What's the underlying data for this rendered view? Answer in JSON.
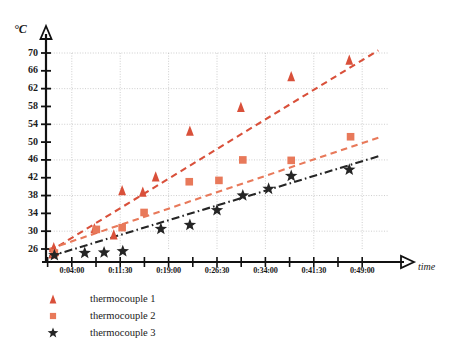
{
  "chart_data": {
    "type": "scatter",
    "title": "",
    "xlabel": "time",
    "ylabel": "°C",
    "grid": true,
    "legend_position": "bottom-left",
    "ylim": [
      24,
      72
    ],
    "yticks": [
      26,
      30,
      34,
      38,
      42,
      46,
      50,
      54,
      58,
      62,
      66,
      70
    ],
    "ytick_labels": [
      "26",
      "30",
      "34",
      "38",
      "42",
      "46",
      "50",
      "54",
      "58",
      "62",
      "66",
      "70"
    ],
    "xtick_labels": [
      "0:04:00",
      "0:11:30",
      "0:19:00",
      "0:26:30",
      "0:34:00",
      "0:41:30",
      "0:49:00"
    ],
    "xtick_minutes": [
      4,
      11.5,
      19,
      26.5,
      34,
      41.5,
      49
    ],
    "xlim_minutes": [
      0,
      53
    ],
    "series": [
      {
        "name": "thermocouple 1",
        "marker": "triangle",
        "color": "#d9503a",
        "trendline": "dashed",
        "points": [
          {
            "x": 1.0,
            "y": 25.0
          },
          {
            "x": 1.2,
            "y": 26.4
          },
          {
            "x": 1.4,
            "y": 25.6
          },
          {
            "x": 7.5,
            "y": 30.7
          },
          {
            "x": 10.5,
            "y": 29.3
          },
          {
            "x": 11.8,
            "y": 39.2
          },
          {
            "x": 15.0,
            "y": 38.9
          },
          {
            "x": 17.0,
            "y": 42.3
          },
          {
            "x": 22.3,
            "y": 52.6
          },
          {
            "x": 30.2,
            "y": 57.9
          },
          {
            "x": 38.0,
            "y": 64.8
          },
          {
            "x": 47.0,
            "y": 68.5
          }
        ],
        "trend_start": {
          "x": 0.5,
          "y": 25.4
        },
        "trend_end": {
          "x": 51.5,
          "y": 70.6
        }
      },
      {
        "name": "thermocouple 2",
        "marker": "square",
        "color": "#e8795a",
        "trendline": "dashed",
        "points": [
          {
            "x": 1.3,
            "y": 25.1
          },
          {
            "x": 7.8,
            "y": 30.4
          },
          {
            "x": 11.8,
            "y": 30.8
          },
          {
            "x": 15.2,
            "y": 34.2
          },
          {
            "x": 22.2,
            "y": 41.1
          },
          {
            "x": 26.8,
            "y": 41.4
          },
          {
            "x": 30.5,
            "y": 46.0
          },
          {
            "x": 38.0,
            "y": 45.9
          },
          {
            "x": 47.2,
            "y": 51.2
          }
        ],
        "trend_start": {
          "x": 0.5,
          "y": 26.0
        },
        "trend_end": {
          "x": 51.5,
          "y": 51.0
        }
      },
      {
        "name": "thermocouple 3",
        "marker": "star",
        "color": "#252525",
        "trendline": "dash-dot",
        "points": [
          {
            "x": 1.3,
            "y": 24.6
          },
          {
            "x": 6.0,
            "y": 25.1
          },
          {
            "x": 9.0,
            "y": 25.2
          },
          {
            "x": 11.9,
            "y": 25.5
          },
          {
            "x": 17.8,
            "y": 30.5
          },
          {
            "x": 22.3,
            "y": 31.4
          },
          {
            "x": 26.5,
            "y": 34.7
          },
          {
            "x": 30.5,
            "y": 38.0
          },
          {
            "x": 34.5,
            "y": 39.5
          },
          {
            "x": 38.0,
            "y": 42.4
          },
          {
            "x": 47.0,
            "y": 43.8
          }
        ],
        "trend_start": {
          "x": 0.5,
          "y": 24.3
        },
        "trend_end": {
          "x": 51.5,
          "y": 46.8
        }
      }
    ]
  },
  "legend": {
    "items": [
      {
        "label": "thermocouple 1",
        "marker": "triangle-icon",
        "color": "#d9503a"
      },
      {
        "label": "thermocouple 2",
        "marker": "square-icon",
        "color": "#e8795a"
      },
      {
        "label": "thermocouple 3",
        "marker": "star-icon",
        "color": "#252525"
      }
    ]
  },
  "caption": {
    "text": ""
  }
}
